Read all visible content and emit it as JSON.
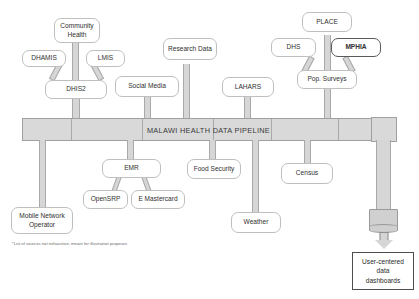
{
  "diagram": {
    "pipeline_label": "MALAWI HEALTH DATA PIPELINE",
    "footnote": "*List of sources not exhaustive, meant for illustration purposes",
    "output_label": "User-centered\ndata\ndashboards",
    "output_line_1": "User-centered",
    "output_line_2": "data",
    "output_line_3": "dashboards",
    "colors": {
      "pipe_fill": "#d6d6d6",
      "pipe_stroke": "#a9a9a9",
      "trunk_fill": "#d9d9d9",
      "node_fill": "#ffffff",
      "node_stroke": "#bfbfbf",
      "emphasis_stroke": "#5a5a5a",
      "text": "#2f2f2f",
      "footnote_text": "#6a6a6a",
      "output_border": "#4d4d4d"
    },
    "nodes": {
      "community_health": "Community\nHealth",
      "community_health_l1": "Community",
      "community_health_l2": "Health",
      "dhamis": "DHAMIS",
      "lmis": "LMIS",
      "dhis2": "DHIS2",
      "social_media": "Social Media",
      "research_data": "Research Data",
      "lahars": "LAHARS",
      "place": "PLACE",
      "dhs": "DHS",
      "mphia": "MPHIA",
      "pop_surveys": "Pop. Surveys",
      "emr": "EMR",
      "opensrp": "OpenSRP",
      "e_mastercard": "E Mastercard",
      "food_security": "Food Security",
      "census": "Census",
      "weather": "Weather",
      "mobile_network_operator": "Mobile Network\nOperator",
      "mno_l1": "Mobile Network",
      "mno_l2": "Operator"
    }
  }
}
